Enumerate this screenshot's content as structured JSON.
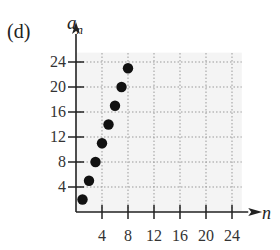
{
  "panel_label": "(d)",
  "chart_data": {
    "type": "scatter",
    "title": "",
    "xlabel": "n",
    "ylabel": "a_n",
    "x": [
      1,
      2,
      3,
      4,
      5,
      6,
      7,
      8
    ],
    "y": [
      2,
      5,
      8,
      11,
      14,
      17,
      20,
      23
    ],
    "xlim": [
      0,
      26
    ],
    "ylim": [
      0,
      26
    ],
    "x_ticks": [
      4,
      8,
      12,
      16,
      20,
      24
    ],
    "y_ticks": [
      4,
      8,
      12,
      16,
      20,
      24
    ],
    "grid": true,
    "grid_style": "dotted",
    "legend": null
  },
  "labels": {
    "y_axis_main": "a",
    "y_axis_sub": "n",
    "x_axis": "n"
  },
  "colors": {
    "points": "#111111",
    "grid": "#9a9a9a",
    "plot_bg": "#f4f4f4",
    "axis": "#222222"
  }
}
